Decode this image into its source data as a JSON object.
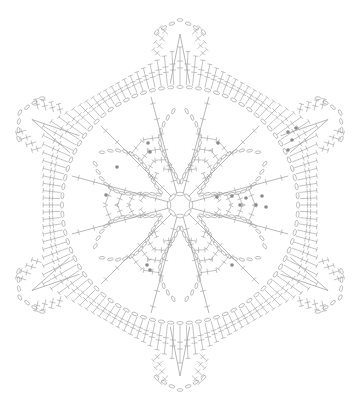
{
  "diagram": {
    "type": "crochet-chart",
    "shape": "hexagonal doily",
    "center": [
      180,
      205
    ],
    "stroke_color": "#9a9a9a",
    "marker_color": "#8a8a8a",
    "background": "#ffffff",
    "center_ring": {
      "radius": 11,
      "chain_count": 8
    },
    "spokes": {
      "count": 12,
      "inner_radius": 12,
      "outer_radius": 112
    },
    "petals": {
      "count": 6
    },
    "chain_ring": {
      "radius": 118
    },
    "outer_stitches": {
      "inner_radius": 120,
      "outer_radius": 158,
      "per_sector": 10
    },
    "points": {
      "count": 6,
      "radius": 185
    },
    "markers": [
      [
        148,
        143
      ],
      [
        150,
        152
      ],
      [
        218,
        143
      ],
      [
        288,
        132
      ],
      [
        292,
        140
      ],
      [
        288,
        150
      ],
      [
        296,
        128
      ],
      [
        217,
        197
      ],
      [
        232,
        196
      ],
      [
        240,
        205
      ],
      [
        246,
        198
      ],
      [
        256,
        205
      ],
      [
        262,
        196
      ],
      [
        266,
        207
      ],
      [
        147,
        265
      ],
      [
        150,
        270
      ],
      [
        106,
        195
      ],
      [
        117,
        167
      ],
      [
        232,
        265
      ]
    ]
  }
}
